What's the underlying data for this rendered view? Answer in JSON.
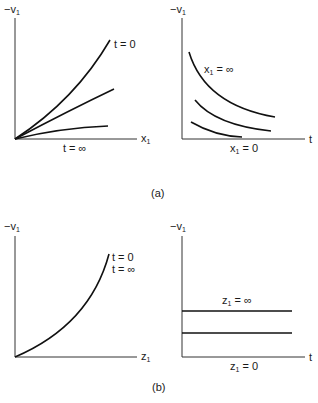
{
  "figure": {
    "panel_a": {
      "caption": "(a)",
      "left": {
        "y_label": "−v",
        "y_sub": "1",
        "x_label": "x",
        "x_sub": "1",
        "curve_top_label": "t = 0",
        "bottom_label": "t = ∞"
      },
      "right": {
        "y_label": "−v",
        "y_sub": "1",
        "x_label": "t",
        "curve_top_label_main": "x",
        "curve_top_label_sub": "1",
        "curve_top_label_rest": " = ∞",
        "bottom_label_main": "x",
        "bottom_label_sub": "1",
        "bottom_label_rest": " = 0"
      }
    },
    "panel_b": {
      "caption": "(b)",
      "left": {
        "y_label": "−v",
        "y_sub": "1",
        "x_label": "z",
        "x_sub": "1",
        "curve_label_1": "t = 0",
        "curve_label_2": "t = ∞"
      },
      "right": {
        "y_label": "−v",
        "y_sub": "1",
        "x_label": "t",
        "top_line_label_main": "z",
        "top_line_label_sub": "1",
        "top_line_label_rest": " = ∞",
        "bottom_label_main": "z",
        "bottom_label_sub": "1",
        "bottom_label_rest": " = 0"
      }
    }
  }
}
